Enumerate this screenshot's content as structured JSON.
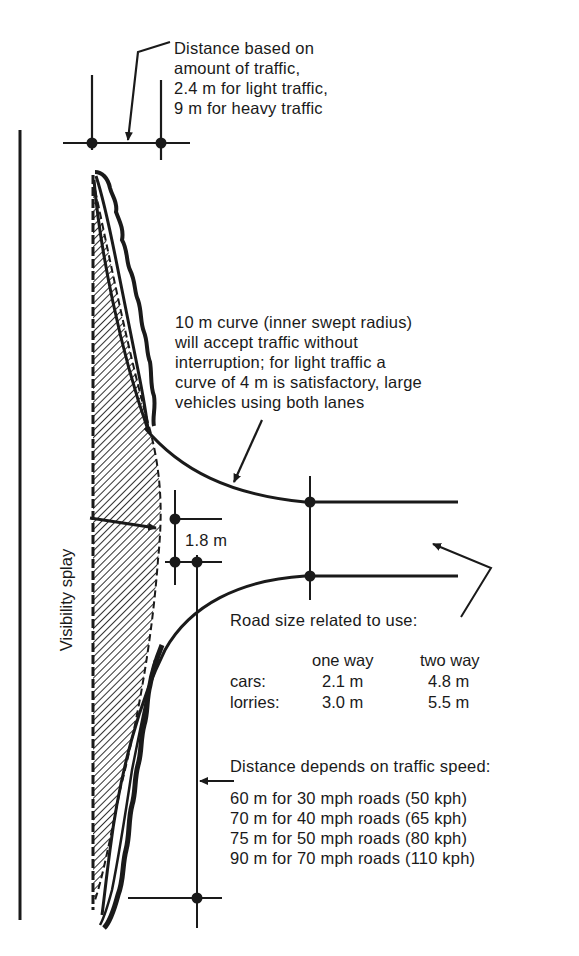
{
  "annotations": {
    "traffic_distance": [
      "Distance based on",
      "amount of traffic,",
      "2.4 m for light traffic,",
      "9 m for heavy traffic"
    ],
    "curve_note": [
      "10 m curve (inner swept radius)",
      "will accept traffic without",
      "interruption; for light traffic a",
      "curve of 4 m is satisfactory, large",
      "vehicles using both lanes"
    ],
    "setback": "1.8 m",
    "visibility_splay": "Visibility splay",
    "road_size": {
      "title": "Road size related to use:",
      "columns": [
        "",
        "one way",
        "two way"
      ],
      "rows": [
        [
          "cars:",
          "2.1 m",
          "4.8 m"
        ],
        [
          "lorries:",
          "3.0 m",
          "5.5 m"
        ]
      ]
    },
    "speed_distance": {
      "title": "Distance depends on traffic speed:",
      "rows": [
        "60 m for 30 mph roads (50 kph)",
        "70 m for 40 mph roads (65 kph)",
        "75 m for 50 mph roads (80 kph)",
        "90 m for 70 mph roads (110 kph)"
      ]
    }
  },
  "colors": {
    "ink": "#1a1a1a",
    "paper": "#ffffff"
  }
}
